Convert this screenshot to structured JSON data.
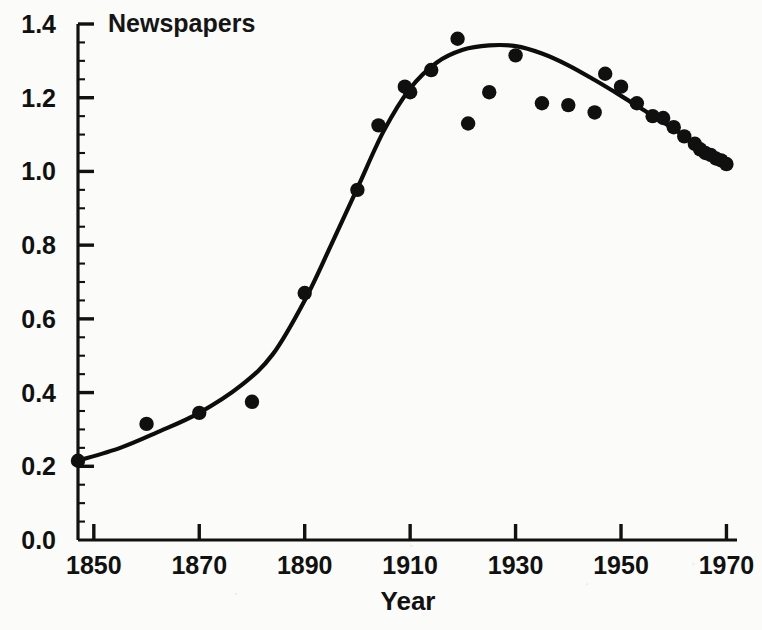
{
  "chart_data": {
    "type": "scatter",
    "title": "Newspapers",
    "xlabel": "Year",
    "ylabel": "",
    "xlim": [
      1847,
      1972
    ],
    "ylim": [
      0.0,
      1.4
    ],
    "grid": false,
    "legend": false,
    "xticks": [
      1850,
      1870,
      1890,
      1910,
      1930,
      1950,
      1970
    ],
    "xticklabels": [
      "1850",
      "1870",
      "1890",
      "1910",
      "1930",
      "1950",
      "1970"
    ],
    "yticks": [
      0.0,
      0.2,
      0.4,
      0.6,
      0.8,
      1.0,
      1.2,
      1.4
    ],
    "yticklabels": [
      "0.0",
      "0.2",
      "0.4",
      "0.6",
      "0.8",
      "1.0",
      "1.2",
      "1.4"
    ],
    "y_minor_tick_step": 0.05,
    "series": [
      {
        "name": "observed",
        "marker": "filled-circle",
        "color": "#101010",
        "points": [
          [
            1847,
            0.215
          ],
          [
            1860,
            0.315
          ],
          [
            1870,
            0.345
          ],
          [
            1880,
            0.375
          ],
          [
            1890,
            0.67
          ],
          [
            1900,
            0.95
          ],
          [
            1904,
            1.125
          ],
          [
            1909,
            1.23
          ],
          [
            1910,
            1.215
          ],
          [
            1914,
            1.275
          ],
          [
            1919,
            1.36
          ],
          [
            1921,
            1.13
          ],
          [
            1925,
            1.215
          ],
          [
            1930,
            1.315
          ],
          [
            1935,
            1.185
          ],
          [
            1940,
            1.18
          ],
          [
            1945,
            1.16
          ],
          [
            1947,
            1.265
          ],
          [
            1950,
            1.23
          ],
          [
            1953,
            1.185
          ],
          [
            1956,
            1.15
          ],
          [
            1958,
            1.145
          ],
          [
            1960,
            1.12
          ],
          [
            1962,
            1.095
          ],
          [
            1964,
            1.075
          ],
          [
            1965,
            1.06
          ],
          [
            1966,
            1.05
          ],
          [
            1967,
            1.045
          ],
          [
            1968,
            1.035
          ],
          [
            1969,
            1.03
          ],
          [
            1970,
            1.02
          ]
        ]
      },
      {
        "name": "fitted-curve",
        "marker": "none",
        "color": "#0d0d0d",
        "points": [
          [
            1847,
            0.215
          ],
          [
            1855,
            0.25
          ],
          [
            1862,
            0.292
          ],
          [
            1870,
            0.345
          ],
          [
            1878,
            0.42
          ],
          [
            1884,
            0.505
          ],
          [
            1890,
            0.65
          ],
          [
            1895,
            0.8
          ],
          [
            1900,
            0.955
          ],
          [
            1905,
            1.11
          ],
          [
            1910,
            1.225
          ],
          [
            1915,
            1.295
          ],
          [
            1920,
            1.33
          ],
          [
            1925,
            1.342
          ],
          [
            1930,
            1.34
          ],
          [
            1935,
            1.32
          ],
          [
            1940,
            1.288
          ],
          [
            1945,
            1.248
          ],
          [
            1950,
            1.205
          ],
          [
            1955,
            1.16
          ],
          [
            1960,
            1.115
          ],
          [
            1965,
            1.068
          ],
          [
            1970,
            1.022
          ]
        ]
      }
    ]
  }
}
